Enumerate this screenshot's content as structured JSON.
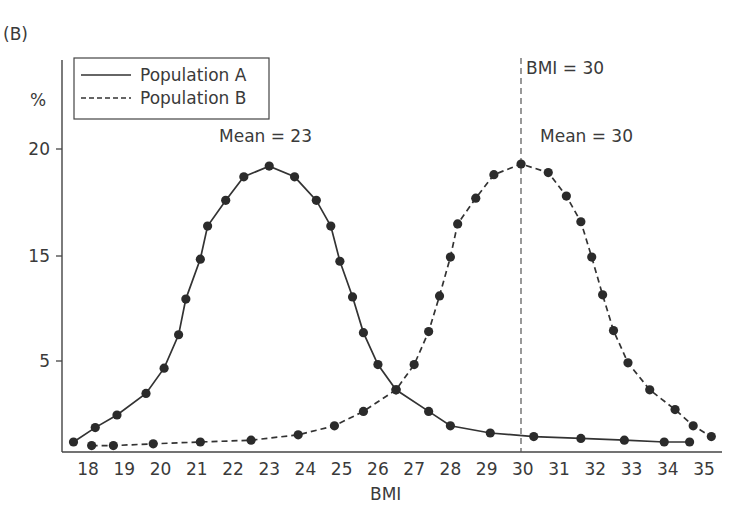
{
  "panel_label": "(B)",
  "chart_data": {
    "type": "line",
    "title": "",
    "xlabel": "BMI",
    "ylabel": "%",
    "xticks": [
      18,
      19,
      20,
      21,
      22,
      23,
      24,
      25,
      26,
      27,
      28,
      29,
      30,
      31,
      32,
      33,
      34,
      35
    ],
    "yticks": [
      20,
      15,
      5
    ],
    "xlim": [
      17.5,
      35.3
    ],
    "grid": false,
    "legend_position": "top-left (inside)",
    "legend": [
      "Population A",
      "Population B"
    ],
    "series": [
      {
        "name": "Population A",
        "style": "solid",
        "points": [
          [
            17.6,
            0.5
          ],
          [
            18.2,
            1.3
          ],
          [
            18.8,
            2.0
          ],
          [
            19.6,
            3.2
          ],
          [
            20.1,
            4.6
          ],
          [
            20.5,
            7.5
          ],
          [
            20.7,
            10.9
          ],
          [
            21.1,
            14.7
          ],
          [
            21.3,
            16.4
          ],
          [
            21.8,
            17.6
          ],
          [
            22.3,
            18.7
          ],
          [
            23.0,
            19.2
          ],
          [
            23.7,
            18.7
          ],
          [
            24.3,
            17.6
          ],
          [
            24.7,
            16.4
          ],
          [
            24.95,
            14.5
          ],
          [
            25.3,
            11.1
          ],
          [
            25.6,
            7.7
          ],
          [
            26.0,
            4.8
          ],
          [
            26.5,
            3.4
          ],
          [
            27.4,
            2.2
          ],
          [
            28.0,
            1.4
          ],
          [
            29.1,
            1.0
          ],
          [
            30.3,
            0.8
          ],
          [
            31.6,
            0.7
          ],
          [
            32.8,
            0.6
          ],
          [
            33.9,
            0.5
          ],
          [
            34.6,
            0.5
          ]
        ]
      },
      {
        "name": "Population B",
        "style": "dashed",
        "points": [
          [
            18.1,
            0.3
          ],
          [
            18.7,
            0.3
          ],
          [
            19.8,
            0.4
          ],
          [
            21.1,
            0.5
          ],
          [
            22.5,
            0.6
          ],
          [
            23.8,
            0.9
          ],
          [
            24.8,
            1.4
          ],
          [
            25.6,
            2.2
          ],
          [
            26.5,
            3.4
          ],
          [
            27.0,
            4.8
          ],
          [
            27.4,
            7.8
          ],
          [
            27.7,
            11.2
          ],
          [
            28.0,
            14.9
          ],
          [
            28.2,
            16.5
          ],
          [
            28.7,
            17.7
          ],
          [
            29.2,
            18.8
          ],
          [
            29.95,
            19.3
          ],
          [
            30.7,
            18.9
          ],
          [
            31.2,
            17.8
          ],
          [
            31.6,
            16.6
          ],
          [
            31.9,
            14.9
          ],
          [
            32.2,
            11.3
          ],
          [
            32.5,
            7.9
          ],
          [
            32.9,
            4.9
          ],
          [
            33.5,
            3.4
          ],
          [
            34.2,
            2.3
          ],
          [
            34.7,
            1.4
          ],
          [
            35.2,
            0.8
          ]
        ]
      }
    ],
    "annotations": [
      {
        "text": "Mean = 23",
        "x": 23,
        "series": "Population A"
      },
      {
        "text": "Mean = 30",
        "x": 30,
        "series": "Population B"
      },
      {
        "text": "BMI = 30",
        "x": 30,
        "type": "vertical dashed reference line"
      }
    ]
  },
  "labels": {
    "y_axis_unit": "%",
    "x_axis_title": "BMI",
    "legend_a": "Population A",
    "legend_b": "Population B",
    "mean_a": "Mean = 23",
    "mean_b": "Mean = 30",
    "ref_line": "BMI = 30"
  }
}
